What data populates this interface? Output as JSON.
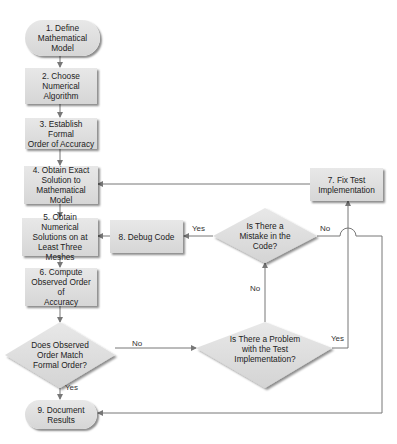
{
  "diagram": {
    "type": "flowchart",
    "nodes": {
      "n1": "1. Define\nMathematical\nModel",
      "n2": "2. Choose\nNumerical\nAlgorithm",
      "n3": "3. Establish Formal\nOrder of Accuracy",
      "n4": "4. Obtain Exact\nSolution to\nMathematical Model",
      "n5": "5. Obtain Numerical\nSolutions on at\nLeast Three Meshes",
      "n6": "6. Compute\nObserved Order of\nAccuracy",
      "n7": "7. Fix Test\nImplementation",
      "n8": "8. Debug Code",
      "n9": "9. Document\nResults",
      "d_match": "Does Observed\nOrder Match\nFormal Order?",
      "d_problem": "Is There a Problem\nwith the Test\nImplementation?",
      "d_mistake": "Is There a\nMistake in the\nCode?"
    },
    "edge_labels": {
      "match_no": "No",
      "match_yes": "Yes",
      "problem_no": "No",
      "problem_yes": "Yes",
      "mistake_yes": "Yes",
      "mistake_no": "No"
    },
    "edges": [
      {
        "from": "n1",
        "to": "n2"
      },
      {
        "from": "n2",
        "to": "n3"
      },
      {
        "from": "n3",
        "to": "n4"
      },
      {
        "from": "n4",
        "to": "n5"
      },
      {
        "from": "n5",
        "to": "n6"
      },
      {
        "from": "n6",
        "to": "d_match"
      },
      {
        "from": "d_match",
        "to": "n9",
        "label": "Yes"
      },
      {
        "from": "d_match",
        "to": "d_problem",
        "label": "No"
      },
      {
        "from": "d_problem",
        "to": "d_mistake",
        "label": "No"
      },
      {
        "from": "d_problem",
        "to": "n7",
        "label": "Yes"
      },
      {
        "from": "d_mistake",
        "to": "n8",
        "label": "Yes"
      },
      {
        "from": "d_mistake",
        "to": "n9",
        "label": "No"
      },
      {
        "from": "n8",
        "to": "n5"
      },
      {
        "from": "n7",
        "to": "n4"
      }
    ],
    "colors": {
      "node_fill": "#dcdcdc",
      "line": "#777777"
    }
  }
}
